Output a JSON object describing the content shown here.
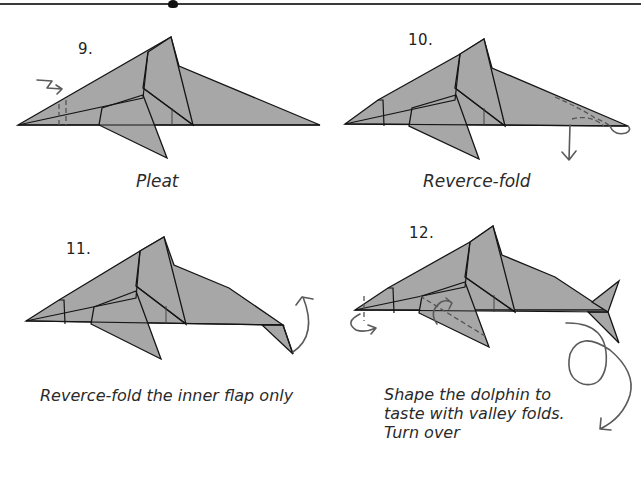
{
  "header": {
    "rule": "top-divider-line"
  },
  "steps": [
    {
      "number": "9.",
      "caption": "Pleat"
    },
    {
      "number": "10.",
      "caption": "Reverce-fold"
    },
    {
      "number": "11.",
      "caption": "Reverce-fold the inner flap only"
    },
    {
      "number": "12.",
      "caption_lines": [
        "Shape the dolphin to",
        "taste with valley folds.",
        "Turn over"
      ]
    }
  ],
  "colors": {
    "paper": "#a7a7a7",
    "line": "#151515",
    "arrow": "#5a5a5a",
    "background": "#ffffff"
  }
}
